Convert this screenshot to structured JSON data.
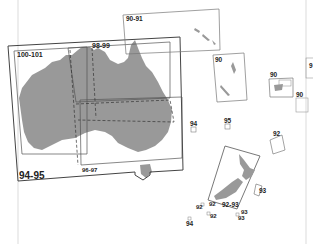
{
  "map": {
    "title": "Australia and Oceania map page index",
    "colors": {
      "land": "#999999",
      "frame": "#444444",
      "frame_light": "#888888",
      "background": "#ffffff"
    },
    "labels": {
      "main_frame": "94-95",
      "nw_frame": "100-101",
      "north_frame": "98-99",
      "south_frame": "96-97",
      "ne_frame": "90-91",
      "vanuatu": "90",
      "fiji": "90",
      "tonga": "90",
      "far_right": "9",
      "lord_howe": "94",
      "norfolk": "95",
      "chatham": "92",
      "nz_frame": "92-93",
      "nz_sub_1": "92",
      "nz_sub_2": "92",
      "nz_sub_3": "92",
      "nz_sub_4": "93",
      "nz_sub_5": "93",
      "nz_east": "93",
      "macquarie": "94"
    }
  }
}
